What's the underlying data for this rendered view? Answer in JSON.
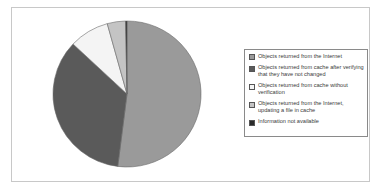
{
  "chart_data": {
    "type": "pie",
    "title": "",
    "legend_position": "right",
    "start_angle_deg": 0,
    "direction": "clockwise",
    "slices": [
      {
        "label": "Objects returned from the Internet",
        "value": 52,
        "color": "#9a9a9a"
      },
      {
        "label": "Objects returned from cache after verifying that they have not changed",
        "value": 35,
        "color": "#5a5a5a"
      },
      {
        "label": "Objects returned from cache without verification",
        "value": 8.7,
        "color": "#f4f4f4"
      },
      {
        "label": "Objects returned from the Internet, updating a file in cache",
        "value": 4,
        "color": "#c4c4c4"
      },
      {
        "label": "Information not available",
        "value": 0.3,
        "color": "#2a2a2a"
      }
    ]
  },
  "legend": {
    "items": [
      {
        "label": "Objects returned from the Internet",
        "color": "#9a9a9a"
      },
      {
        "label": "Objects returned from cache after verifying that they have not changed",
        "color": "#5a5a5a"
      },
      {
        "label": "Objects returned from cache without verification",
        "color": "#f4f4f4"
      },
      {
        "label": "Objects returned from the Internet, updating a file in cache",
        "color": "#c4c4c4"
      },
      {
        "label": "Information not available",
        "color": "#2a2a2a"
      }
    ]
  }
}
